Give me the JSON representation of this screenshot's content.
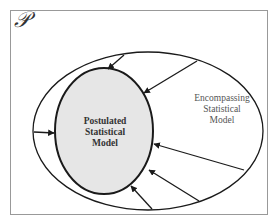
{
  "diagram": {
    "frame_label": "𝒫",
    "inner_model": {
      "line1": "Postulated",
      "line2": "Statistical",
      "line3": "Model",
      "fill": "#e6e6e6"
    },
    "outer_model": {
      "line1": "Encompassing",
      "line2": "Statistical",
      "line3": "Model"
    },
    "colors": {
      "frame": "#999999",
      "stroke": "#1a1a1a",
      "inner_fill": "#e6e6e6"
    },
    "arrows": [
      {
        "from": "outer-top",
        "to": "inner-top"
      },
      {
        "from": "outer-top-right",
        "to": "inner-upper-right"
      },
      {
        "from": "outer-left",
        "to": "inner-left"
      },
      {
        "from": "outer-right",
        "to": "inner-right"
      },
      {
        "from": "outer-lower-right",
        "to": "inner-lower-right"
      },
      {
        "from": "outer-bottom",
        "to": "inner-bottom"
      }
    ]
  }
}
